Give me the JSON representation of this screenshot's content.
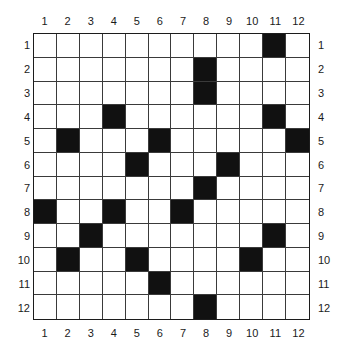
{
  "figure": {
    "name": "grid-puzzle",
    "rows": 12,
    "columns": 12,
    "column_labels_top": [
      "1",
      "2",
      "3",
      "4",
      "5",
      "6",
      "7",
      "8",
      "9",
      "10",
      "11",
      "12"
    ],
    "column_labels_bottom": [
      "1",
      "2",
      "3",
      "4",
      "5",
      "6",
      "7",
      "8",
      "9",
      "10",
      "11",
      "12"
    ],
    "row_labels_left": [
      "1",
      "2",
      "3",
      "4",
      "5",
      "6",
      "7",
      "8",
      "9",
      "10",
      "11",
      "12"
    ],
    "row_labels_right": [
      "1",
      "2",
      "3",
      "4",
      "5",
      "6",
      "7",
      "8",
      "9",
      "10",
      "11",
      "12"
    ],
    "filled_color": "#111111",
    "empty_color": "#ffffff",
    "grid_line_color": "#3a3a3a",
    "border_color": "#1c1c1c"
  },
  "chart_data": {
    "type": "heatmap",
    "title": "",
    "xlabel": "",
    "ylabel": "",
    "categories": [
      "1",
      "2",
      "3",
      "4",
      "5",
      "6",
      "7",
      "8",
      "9",
      "10",
      "11",
      "12"
    ],
    "row_categories": [
      "1",
      "2",
      "3",
      "4",
      "5",
      "6",
      "7",
      "8",
      "9",
      "10",
      "11",
      "12"
    ],
    "legend": [],
    "grid": [
      [
        0,
        0,
        0,
        0,
        0,
        0,
        0,
        0,
        0,
        0,
        1,
        0
      ],
      [
        0,
        0,
        0,
        0,
        0,
        0,
        0,
        1,
        0,
        0,
        0,
        0
      ],
      [
        0,
        0,
        0,
        0,
        0,
        0,
        0,
        1,
        0,
        0,
        0,
        0
      ],
      [
        0,
        0,
        0,
        1,
        0,
        0,
        0,
        0,
        0,
        0,
        1,
        0
      ],
      [
        0,
        1,
        0,
        0,
        0,
        1,
        0,
        0,
        0,
        0,
        0,
        1
      ],
      [
        0,
        0,
        0,
        0,
        1,
        0,
        0,
        0,
        1,
        0,
        0,
        0
      ],
      [
        0,
        0,
        0,
        0,
        0,
        0,
        0,
        1,
        0,
        0,
        0,
        0
      ],
      [
        1,
        0,
        0,
        1,
        0,
        0,
        1,
        0,
        0,
        0,
        0,
        0
      ],
      [
        0,
        0,
        1,
        0,
        0,
        0,
        0,
        0,
        0,
        0,
        1,
        0
      ],
      [
        0,
        1,
        0,
        0,
        1,
        0,
        0,
        0,
        0,
        1,
        0,
        0
      ],
      [
        0,
        0,
        0,
        0,
        0,
        1,
        0,
        0,
        0,
        0,
        0,
        0
      ],
      [
        0,
        0,
        0,
        0,
        0,
        0,
        0,
        1,
        0,
        0,
        0,
        0
      ]
    ],
    "filled_cells_by_row": {
      "1": [
        11
      ],
      "2": [
        8
      ],
      "3": [
        8
      ],
      "4": [
        4,
        11
      ],
      "5": [
        2,
        6,
        12
      ],
      "6": [
        5,
        9
      ],
      "7": [
        8
      ],
      "8": [
        1,
        4,
        7
      ],
      "9": [
        3,
        11
      ],
      "10": [
        2,
        5,
        10
      ],
      "11": [
        6
      ],
      "12": [
        8
      ]
    },
    "filled_count": 22,
    "total_cells": 144
  }
}
